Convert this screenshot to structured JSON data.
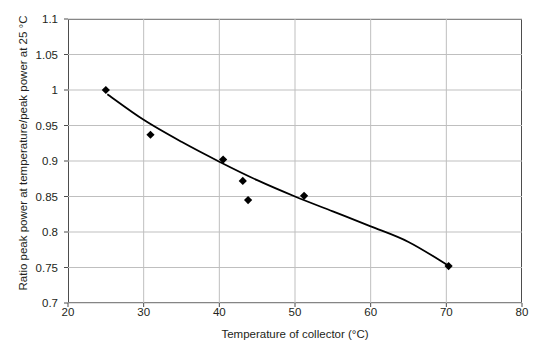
{
  "chart_data": {
    "type": "scatter",
    "title": "",
    "xlabel": "Temperature of collector (°C)",
    "ylabel": "Ratio peak power at temperature/peak power at 25 °C",
    "xlim": [
      20,
      80
    ],
    "ylim": [
      0.7,
      1.1
    ],
    "xticks": [
      20,
      30,
      40,
      50,
      60,
      70,
      80
    ],
    "xtick_labels": [
      "20",
      "30",
      "40",
      "50",
      "60",
      "70",
      "80"
    ],
    "yticks": [
      0.7,
      0.75,
      0.8,
      0.85,
      0.9,
      0.95,
      1,
      1.05,
      1.1
    ],
    "ytick_labels": [
      "0.7",
      "0.75",
      "0.8",
      "0.85",
      "0.9",
      "0.95",
      "1",
      "1.05",
      "1.1"
    ],
    "grid": "horizontal-and-vertical",
    "legend": "none",
    "series": [
      {
        "name": "Measured ratio",
        "type": "scatter",
        "marker": "diamond",
        "color": "#000000",
        "points": [
          {
            "x": 25.0,
            "y": 1.0
          },
          {
            "x": 30.9,
            "y": 0.937
          },
          {
            "x": 40.5,
            "y": 0.902
          },
          {
            "x": 43.1,
            "y": 0.872
          },
          {
            "x": 43.8,
            "y": 0.845
          },
          {
            "x": 51.2,
            "y": 0.851
          },
          {
            "x": 70.3,
            "y": 0.752
          }
        ]
      },
      {
        "name": "Fitted trend curve",
        "type": "line",
        "color": "#000000",
        "points": [
          {
            "x": 25.2,
            "y": 0.994
          },
          {
            "x": 30.0,
            "y": 0.958
          },
          {
            "x": 35.0,
            "y": 0.927
          },
          {
            "x": 40.0,
            "y": 0.899
          },
          {
            "x": 45.0,
            "y": 0.873
          },
          {
            "x": 50.0,
            "y": 0.85
          },
          {
            "x": 55.0,
            "y": 0.829
          },
          {
            "x": 60.0,
            "y": 0.808
          },
          {
            "x": 65.0,
            "y": 0.786
          },
          {
            "x": 70.4,
            "y": 0.752
          }
        ]
      }
    ]
  },
  "axes": {
    "frame_color": "#4d4d4d",
    "grid_color": "#bfbfbf"
  }
}
